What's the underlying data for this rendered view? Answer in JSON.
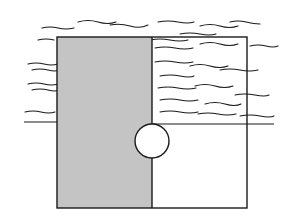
{
  "diagram": {
    "type": "sketch",
    "colors": {
      "background": "#ffffff",
      "ink": "#1a1a1a",
      "shade": "#c4c4c4"
    },
    "shapes": {
      "outer_rect": {
        "x": 57,
        "y": 37,
        "w": 190,
        "h": 171
      },
      "shaded_rect": {
        "x": 57,
        "y": 37,
        "w": 95,
        "h": 171
      },
      "circle": {
        "cx": 152,
        "cy": 141,
        "r": 17
      },
      "horizon_y": 122
    }
  }
}
